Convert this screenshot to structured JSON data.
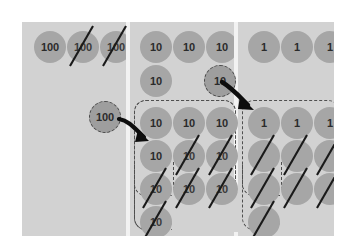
{
  "diagram": {
    "columns": [
      {
        "name": "hundreds",
        "value_label": "100",
        "rows": [
          {
            "discs": [
              {
                "label": "100",
                "struck": false
              },
              {
                "label": "100",
                "struck": true
              },
              {
                "label": "100",
                "struck": true
              }
            ]
          }
        ],
        "moving_disc": {
          "label": "100",
          "struck": false
        },
        "group": null
      },
      {
        "name": "tens",
        "value_label": "10",
        "rows": [
          {
            "discs": [
              {
                "label": "10",
                "struck": false
              },
              {
                "label": "10",
                "struck": false
              },
              {
                "label": "10",
                "struck": false
              }
            ]
          },
          {
            "discs": [
              {
                "label": "10",
                "struck": false
              }
            ]
          }
        ],
        "moving_disc": {
          "label": "10",
          "struck": false
        },
        "group": {
          "rows": [
            [
              {
                "label": "10",
                "struck": false
              },
              {
                "label": "10",
                "struck": false
              },
              {
                "label": "10",
                "struck": false
              }
            ],
            [
              {
                "label": "10",
                "struck": false
              },
              {
                "label": "10",
                "struck": true
              },
              {
                "label": "10",
                "struck": true
              }
            ],
            [
              {
                "label": "10",
                "struck": true
              },
              {
                "label": "10",
                "struck": true
              },
              {
                "label": "10",
                "struck": true
              }
            ],
            [
              {
                "label": "10",
                "struck": true
              }
            ]
          ]
        }
      },
      {
        "name": "ones",
        "value_label": "1",
        "rows": [
          {
            "discs": [
              {
                "label": "1",
                "struck": false
              },
              {
                "label": "1",
                "struck": false
              },
              {
                "label": "1",
                "struck": false
              }
            ]
          }
        ],
        "moving_disc": null,
        "group": {
          "rows": [
            [
              {
                "label": "1",
                "struck": false
              },
              {
                "label": "1",
                "struck": false
              },
              {
                "label": "1",
                "struck": false
              }
            ],
            [
              {
                "label": "",
                "struck": true
              },
              {
                "label": "",
                "struck": true
              },
              {
                "label": "",
                "struck": true
              }
            ],
            [
              {
                "label": "",
                "struck": true
              },
              {
                "label": "",
                "struck": true
              },
              {
                "label": "",
                "struck": true
              }
            ],
            [
              {
                "label": "",
                "struck": true
              }
            ]
          ]
        }
      }
    ],
    "arrows": [
      {
        "name": "arrow-hundred-to-tens",
        "from": "hundreds-moving-disc",
        "to": "tens-group"
      },
      {
        "name": "arrow-ten-to-ones",
        "from": "tens-moving-disc",
        "to": "ones-group"
      }
    ],
    "colors": {
      "board_background": "#d2d2d2",
      "disc_fill": "#a6a6a6",
      "divider": "#f2f2f2",
      "outline_dashed": "#4f4f4f",
      "slash_stroke": "#1a1a1a",
      "digit_text": "#2b2b2b"
    }
  }
}
